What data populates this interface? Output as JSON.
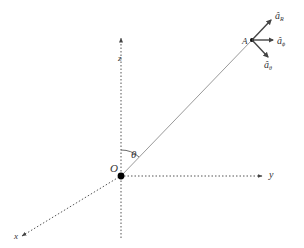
{
  "diagram": {
    "title": "",
    "labels": {
      "z_axis": "z",
      "y_axis": "y",
      "x_axis": "x",
      "origin": "O",
      "point": "A",
      "theta": "θ",
      "unit_R_base": "â",
      "unit_R_sub": "R",
      "unit_phi_base": "â",
      "unit_phi_sub": "ϕ",
      "unit_theta_base": "â",
      "unit_theta_sub": "θ"
    },
    "colors": {
      "axis": "#555555",
      "radius_line": "#9a9a9a",
      "vector": "#444444",
      "point": "#000000",
      "text": "#333333"
    }
  }
}
